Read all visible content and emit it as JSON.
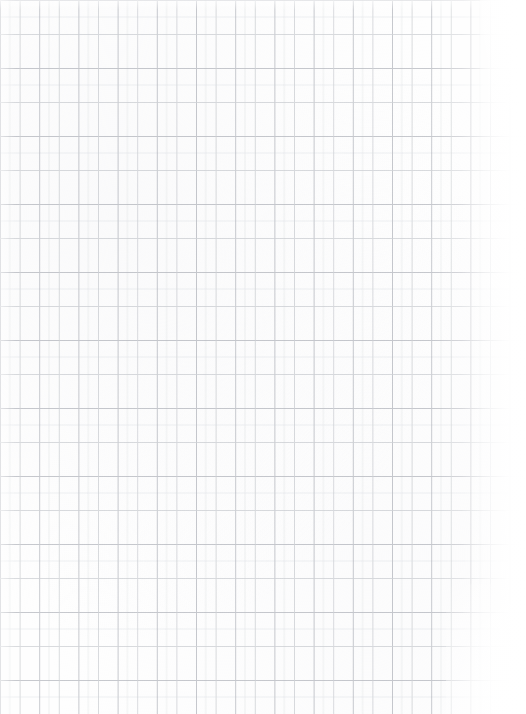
{
  "document": {
    "kind": "scanned-grid-paper",
    "page_width": 526,
    "page_height": 714,
    "background_color": "#ffffff",
    "paper_color": "#fefefe",
    "alt_text": "Scanned sheet of white grid paper printed with an interlocking offset square lattice",
    "text_content": "",
    "visible_labels": []
  },
  "pattern": {
    "name": "interlocking-offset-squares",
    "description": "Two identical square lattices drawn in thin grey line, the second offset by half a period horizontally and vertically, producing a woven puzzle-piece appearance",
    "period_x": 39.2,
    "period_y": 68.0,
    "square_width": 39.2,
    "square_height": 68.0,
    "offset_x": 19.6,
    "offset_y": 34.0,
    "line_color_primary": "#b9bcc2",
    "line_color_secondary": "#cfd2d6",
    "line_color_faint": "#e4e6e9",
    "line_width": 0.8,
    "columns_visible": 14,
    "rows_visible": 11
  },
  "scan_effects": {
    "right_edge_fade": true,
    "right_edge_fade_width": 64,
    "bottom_right_vignette": true,
    "top_edge_fade": true,
    "left_edge_fade": true,
    "grain": true
  }
}
